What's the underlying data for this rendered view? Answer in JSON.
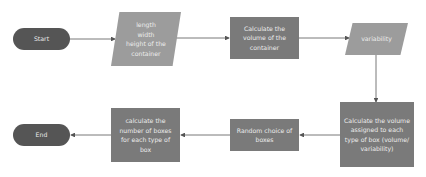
{
  "flowchart": {
    "nodes": [
      {
        "id": "start",
        "shape": "terminator",
        "label": "Start"
      },
      {
        "id": "input-dimensions",
        "shape": "data",
        "label": "length\nwidth\nheight of the container"
      },
      {
        "id": "calc-container-volume",
        "shape": "process",
        "label": "Calculate the volume of the container"
      },
      {
        "id": "variability",
        "shape": "data",
        "label": "variability"
      },
      {
        "id": "calc-volume-per-type",
        "shape": "process",
        "label": "Calculate the volume assigned to each type of box (volume/ variability)"
      },
      {
        "id": "random-choice",
        "shape": "process",
        "label": "Random choice of boxes"
      },
      {
        "id": "calc-number-boxes",
        "shape": "process",
        "label": "calculate the number of boxes for each type of box"
      },
      {
        "id": "end",
        "shape": "terminator",
        "label": "End"
      }
    ],
    "edges": [
      {
        "from": "start",
        "to": "input-dimensions"
      },
      {
        "from": "input-dimensions",
        "to": "calc-container-volume"
      },
      {
        "from": "calc-container-volume",
        "to": "variability"
      },
      {
        "from": "variability",
        "to": "calc-volume-per-type"
      },
      {
        "from": "calc-volume-per-type",
        "to": "random-choice"
      },
      {
        "from": "random-choice",
        "to": "calc-number-boxes"
      },
      {
        "from": "calc-number-boxes",
        "to": "end"
      }
    ]
  },
  "labels": {
    "start": "Start",
    "dim_line1": "length",
    "dim_line2": "width",
    "dim_line3": "height of the",
    "dim_line4": "container",
    "calc_container": "Calculate the volume of the container",
    "variability": "variability",
    "calc_per_type": "Calculate the volume assigned to each type of box (volume/ variability)",
    "random_choice": "Random choice of boxes",
    "calc_number": "calculate the number of boxes for each type of box",
    "end": "End"
  },
  "colors": {
    "terminator": "#555555",
    "process": "#7a7a7a",
    "data": "#9c9c9c",
    "connector": "#555555",
    "text": "#ececec"
  }
}
